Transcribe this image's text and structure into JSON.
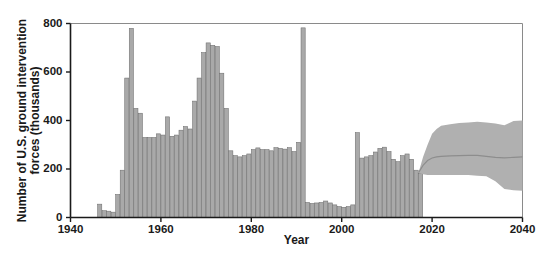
{
  "chart_data": {
    "type": "bar",
    "title": "",
    "xlabel": "Year",
    "ylabel": "Number of U.S. ground intervention forces (thousands)",
    "xlim": [
      1940,
      2040
    ],
    "ylim": [
      0,
      800
    ],
    "xticks": [
      1940,
      1960,
      1980,
      2000,
      2020,
      2040
    ],
    "xtick_labels": [
      "1940",
      "1960",
      "1980",
      "2000",
      "2020",
      "2040"
    ],
    "yticks": [
      0,
      200,
      400,
      600,
      800
    ],
    "ytick_labels": [
      "0",
      "200",
      "400",
      "600",
      "800"
    ],
    "grid": false,
    "legend": "none",
    "bar_color": "#a9a9a9",
    "bar_edge_color": "#6e6e6e",
    "band_color": "#b0b0b0",
    "median_color": "#8d8d8d",
    "axis_color": "#1a1a1a",
    "categories": [
      1946,
      1947,
      1948,
      1949,
      1950,
      1951,
      1952,
      1953,
      1954,
      1955,
      1956,
      1957,
      1958,
      1959,
      1960,
      1961,
      1962,
      1963,
      1964,
      1965,
      1966,
      1967,
      1968,
      1969,
      1970,
      1971,
      1972,
      1973,
      1974,
      1975,
      1976,
      1977,
      1978,
      1979,
      1980,
      1981,
      1982,
      1983,
      1984,
      1985,
      1986,
      1987,
      1988,
      1989,
      1990,
      1991,
      1992,
      1993,
      1994,
      1995,
      1996,
      1997,
      1998,
      1999,
      2000,
      2001,
      2002,
      2003,
      2004,
      2005,
      2006,
      2007,
      2008,
      2009,
      2010,
      2011,
      2012,
      2013,
      2014,
      2015,
      2016,
      2017
    ],
    "values": [
      55,
      28,
      26,
      22,
      95,
      195,
      575,
      780,
      450,
      430,
      330,
      330,
      330,
      345,
      340,
      415,
      335,
      340,
      360,
      375,
      365,
      480,
      575,
      680,
      720,
      710,
      705,
      595,
      450,
      275,
      255,
      250,
      255,
      262,
      280,
      287,
      280,
      280,
      275,
      288,
      285,
      282,
      288,
      272,
      310,
      782,
      62,
      58,
      60,
      62,
      68,
      60,
      52,
      45,
      42,
      45,
      52,
      350,
      245,
      250,
      255,
      270,
      285,
      290,
      272,
      240,
      230,
      255,
      262,
      240,
      195,
      182
    ],
    "projection": {
      "label": "projected range",
      "start_year": 2017,
      "end_year": 2040,
      "x": [
        2017,
        2018,
        2019,
        2020,
        2021,
        2022,
        2024,
        2026,
        2028,
        2030,
        2032,
        2034,
        2036,
        2038,
        2040
      ],
      "upper": [
        185,
        250,
        300,
        345,
        365,
        378,
        385,
        390,
        392,
        395,
        392,
        388,
        380,
        398,
        400
      ],
      "median": [
        185,
        215,
        235,
        245,
        250,
        252,
        254,
        255,
        256,
        256,
        252,
        248,
        246,
        248,
        250
      ],
      "lower": [
        185,
        178,
        175,
        175,
        175,
        175,
        175,
        175,
        175,
        172,
        170,
        150,
        118,
        112,
        110
      ]
    }
  }
}
